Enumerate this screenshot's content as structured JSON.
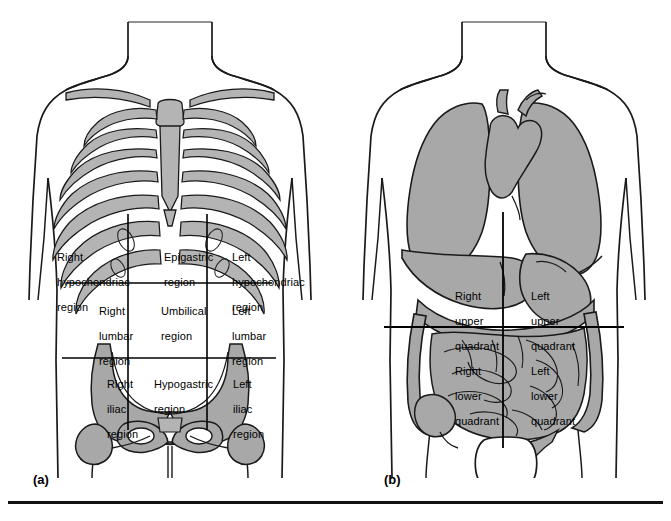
{
  "figure": {
    "background_color": "#ffffff",
    "organ_fill_color": "#a8a8a8",
    "bone_fill_color": "#b4b4b4",
    "outline_color": "#1a1a1a",
    "grid_line_color": "#000000",
    "bottom_rule_color": "#111111"
  },
  "panels": [
    {
      "id": "a",
      "caption": "(a)",
      "scheme": "nine-regions",
      "description": "Anterior torso with skeleton showing the nine abdominal regions",
      "grid": {
        "vertical_lines_x": [
          128,
          207
        ],
        "horizontal_lines_y": [
          283,
          358
        ]
      },
      "labels": [
        {
          "name": "right-hypochondriac",
          "lines": [
            "Right",
            "hypochondriac",
            "region"
          ],
          "x": 38,
          "y": 238
        },
        {
          "name": "epigastric",
          "lines": [
            "Epigastric",
            "region"
          ],
          "x": 145,
          "y": 238
        },
        {
          "name": "left-hypochondriac",
          "lines": [
            "Left",
            "hypochondriac",
            "region"
          ],
          "x": 213,
          "y": 238
        },
        {
          "name": "right-lumbar",
          "lines": [
            "Right",
            "lumbar",
            "region"
          ],
          "x": 80,
          "y": 292
        },
        {
          "name": "umbilical",
          "lines": [
            "Umbilical",
            "region"
          ],
          "x": 142,
          "y": 292
        },
        {
          "name": "left-lumbar",
          "lines": [
            "Left",
            "lumbar",
            "region"
          ],
          "x": 213,
          "y": 292
        },
        {
          "name": "right-iliac",
          "lines": [
            "Right",
            "iliac",
            "region"
          ],
          "x": 88,
          "y": 365
        },
        {
          "name": "hypogastric",
          "lines": [
            "Hypogastric",
            "region"
          ],
          "x": 135,
          "y": 365
        },
        {
          "name": "left-iliac",
          "lines": [
            "Left",
            "iliac",
            "region"
          ],
          "x": 214,
          "y": 365
        }
      ],
      "structures": [
        "clavicle",
        "sternum",
        "xiphoid-process",
        "ribs",
        "costal-margin",
        "pelvis",
        "ilium",
        "obturator-foramen",
        "femur-head",
        "pubic-symphysis"
      ]
    },
    {
      "id": "b",
      "caption": "(b)",
      "scheme": "four-quadrants",
      "description": "Anterior torso with viscera showing the four abdominal quadrants",
      "grid": {
        "vertical_lines_x": [
          163,
          163
        ],
        "horizontal_lines_y": [
          327
        ]
      },
      "labels": [
        {
          "name": "right-upper-quadrant",
          "lines": [
            "Right",
            "upper",
            "quadrant"
          ],
          "x": 96,
          "y": 277
        },
        {
          "name": "left-upper-quadrant",
          "lines": [
            "Left",
            "upper",
            "quadrant"
          ],
          "x": 172,
          "y": 277
        },
        {
          "name": "right-lower-quadrant",
          "lines": [
            "Right",
            "lower",
            "quadrant"
          ],
          "x": 96,
          "y": 352
        },
        {
          "name": "left-lower-quadrant",
          "lines": [
            "Left",
            "lower",
            "quadrant"
          ],
          "x": 172,
          "y": 352
        }
      ],
      "structures": [
        "lungs",
        "heart",
        "aorta",
        "liver",
        "stomach",
        "transverse-colon",
        "ascending-colon",
        "descending-colon",
        "small-intestine",
        "cecum",
        "sigmoid-colon",
        "urinary-bladder"
      ]
    }
  ]
}
